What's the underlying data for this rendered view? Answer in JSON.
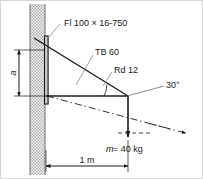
{
  "figure": {
    "type": "engineering-detail-drawing"
  },
  "labels": {
    "flat_plate": "Fl 100 × 16-750",
    "tie_bar": "TB 60",
    "round_bar": "Rd 12",
    "angle": "30°",
    "mass": "m = 40 kg",
    "mass_symbol": "m",
    "mass_value": "= 40 kg",
    "span": "1 m",
    "height": "a"
  },
  "geometry": {
    "wall_hatch_color": "#b0b0b0",
    "line_color": "#1a1a1a",
    "leader_color": "#8a8a8a",
    "border_color": "#d8d8d8",
    "angle_degrees": 30,
    "span_meters": 1,
    "mass_kg": 40
  }
}
